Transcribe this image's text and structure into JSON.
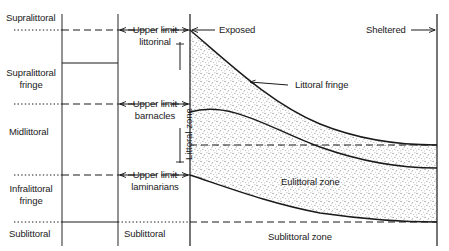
{
  "figure": {
    "type": "diagram"
  },
  "left_column": {
    "name": "zone-scheme-column",
    "items": [
      {
        "label": "Supralittoral"
      },
      {
        "label": "Supralittoral\nfringe"
      },
      {
        "label": "Midlittoral"
      },
      {
        "label": "Infralittoral\nfringe"
      },
      {
        "label": "Sublittoral"
      }
    ]
  },
  "limit_labels": {
    "upper_limit_littorinal": "Upper limit\nlittorinal",
    "upper_limit_barnacles": "Upper limit\nbarnacles",
    "upper_limit_laminarians": "Upper limit\nlaminarians",
    "sublittoral": "Sublittoral"
  },
  "axis_labels": {
    "exposed": "Exposed",
    "sheltered": "Sheltered",
    "littoral_zone": "Littoral zone"
  },
  "plot_zone_labels": {
    "littoral_fringe": "Littoral fringe",
    "eulittoral_zone": "Eulittoral zone",
    "sublittoral_zone": "Sublittoral zone"
  },
  "colors": {
    "line": "#1a1a1a",
    "text": "#1a1a1a",
    "stipple": "#6b6b6b",
    "background": "#ffffff"
  },
  "geometry": {
    "vertical_rules_x": [
      62,
      118,
      190,
      437
    ],
    "horizontal_dashed_y": [
      30,
      104,
      175,
      222
    ],
    "solid_divider_y": 63,
    "curve_start_y": [
      30,
      112,
      175
    ],
    "curve_end_y": [
      145,
      168,
      222
    ]
  }
}
